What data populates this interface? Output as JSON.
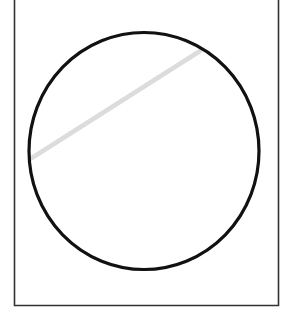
{
  "diagram": {
    "type": "geometry",
    "frame": {
      "x": 14.5,
      "y_top": -2,
      "x_right": 278.5,
      "y_bottom": 305.5,
      "stroke": "#333333",
      "stroke_width": 1.6,
      "top_edge_visible": false
    },
    "circle": {
      "cx": 144,
      "cy": 151,
      "rx": 115,
      "ry": 118.5,
      "stroke": "#111111",
      "stroke_width": 3.2,
      "fill": "none"
    },
    "chord": {
      "x1": 31,
      "y1": 158.5,
      "x2": 200,
      "y2": 51,
      "stroke": "#dcdcdc",
      "stroke_width": 4.5
    }
  }
}
